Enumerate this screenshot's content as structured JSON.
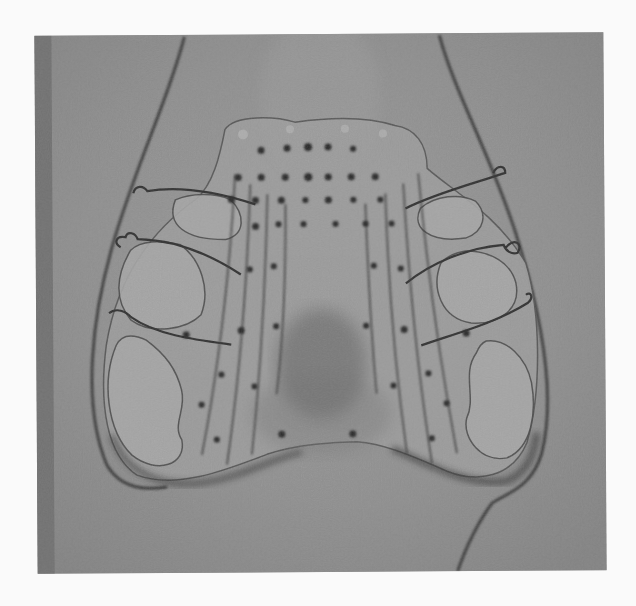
{
  "image": {
    "subject": "Electropalatography artificial palate with electrode grid, grayscale photograph",
    "colors": {
      "page_background": "#fafafa",
      "photo_background": "#8d8d8d",
      "left_strip": "#6f6f6f",
      "palate_body": "#9a9a9a",
      "palate_highlight": "#a8a8a8",
      "wire": "#3a3a3a",
      "electrode": "#2a2a2a"
    }
  }
}
